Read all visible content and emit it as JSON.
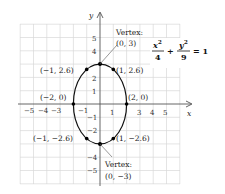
{
  "figure": {
    "equation": {
      "x_num": "x",
      "x_exp": "2",
      "x_den": "4",
      "plus": "+",
      "y_num": "y",
      "y_exp": "2",
      "y_den": "9",
      "equals": "= 1"
    },
    "axes": {
      "x_label": "x",
      "y_label": "y",
      "x_ticks": [
        "−5",
        "−4",
        "−3",
        "−1",
        "1",
        "3",
        "4",
        "5"
      ],
      "y_ticks": [
        "5",
        "4",
        "2",
        "1",
        "−1",
        "−2",
        "−4",
        "−5"
      ]
    },
    "points": [
      {
        "label": "(0, 3)",
        "caption": "Vertex:"
      },
      {
        "label": "(−1, 2.6)"
      },
      {
        "label": "(1, 2.6)"
      },
      {
        "label": "(−2, 0)"
      },
      {
        "label": "(2, 0)"
      },
      {
        "label": "(−1, −2.6)"
      },
      {
        "label": "(1, −2.6)"
      },
      {
        "label": "(0, −3)",
        "caption": "Vertex:"
      }
    ],
    "colors": {
      "grid": "#d9d9d9",
      "axis": "#555555",
      "curve": "#111111",
      "point": "#000000"
    }
  }
}
